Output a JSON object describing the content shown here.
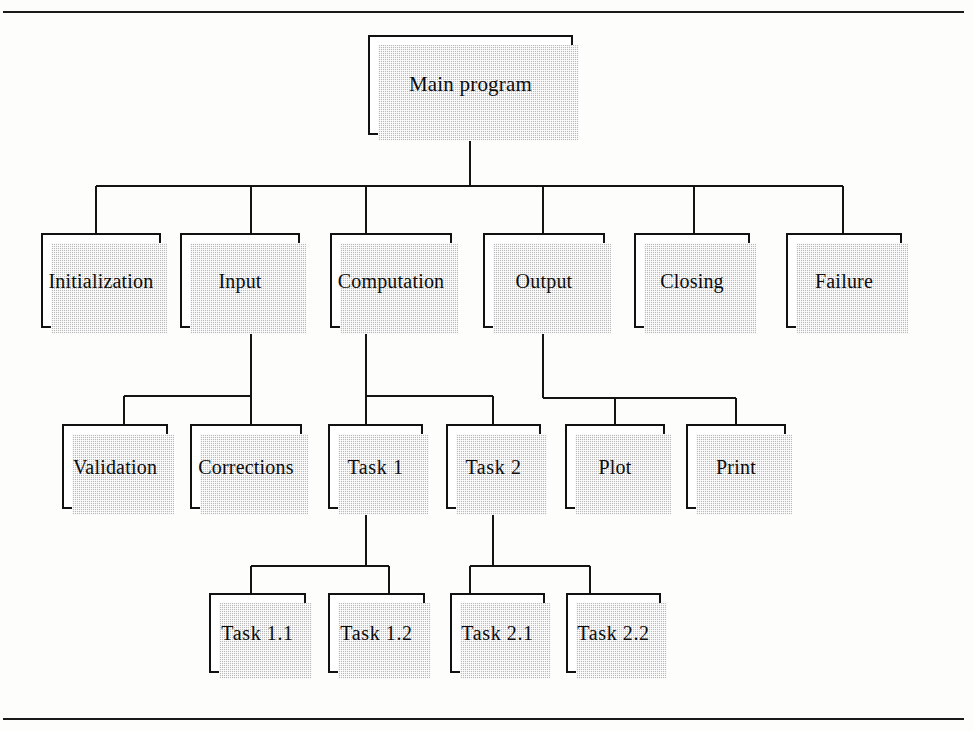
{
  "diagram": {
    "type": "hierarchy-tree",
    "frame": {
      "top_rule": true,
      "bottom_rule": true,
      "border_color": "#1a1a1a"
    },
    "style": {
      "box_fill": "#ffffff",
      "box_border": "#111111",
      "shadow_color": "#b9b9b9",
      "line_color": "#141414",
      "text_color": "#0c0c0c"
    },
    "nodes": [
      {
        "id": "main",
        "label": "Main program",
        "level": 0,
        "x": 368,
        "y": 35,
        "w": 205,
        "h": 100,
        "parent": null
      },
      {
        "id": "init",
        "label": "Initialization",
        "level": 1,
        "x": 41,
        "y": 233,
        "w": 120,
        "h": 95,
        "parent": "main"
      },
      {
        "id": "input",
        "label": "Input",
        "level": 1,
        "x": 180,
        "y": 233,
        "w": 120,
        "h": 95,
        "parent": "main"
      },
      {
        "id": "computation",
        "label": "Computation",
        "level": 1,
        "x": 330,
        "y": 233,
        "w": 122,
        "h": 95,
        "parent": "main"
      },
      {
        "id": "output",
        "label": "Output",
        "level": 1,
        "x": 483,
        "y": 233,
        "w": 122,
        "h": 95,
        "parent": "main"
      },
      {
        "id": "closing",
        "label": "Closing",
        "level": 1,
        "x": 634,
        "y": 233,
        "w": 116,
        "h": 95,
        "parent": "main"
      },
      {
        "id": "failure",
        "label": "Failure",
        "level": 1,
        "x": 786,
        "y": 233,
        "w": 116,
        "h": 95,
        "parent": "main"
      },
      {
        "id": "validation",
        "label": "Validation",
        "level": 2,
        "x": 62,
        "y": 424,
        "w": 106,
        "h": 85,
        "parent": "input"
      },
      {
        "id": "corrections",
        "label": "Corrections",
        "level": 2,
        "x": 190,
        "y": 424,
        "w": 112,
        "h": 85,
        "parent": "input"
      },
      {
        "id": "task1",
        "label": "Task 1",
        "level": 2,
        "x": 328,
        "y": 424,
        "w": 95,
        "h": 85,
        "parent": "computation"
      },
      {
        "id": "task2",
        "label": "Task 2",
        "level": 2,
        "x": 446,
        "y": 424,
        "w": 95,
        "h": 85,
        "parent": "computation"
      },
      {
        "id": "plot",
        "label": "Plot",
        "level": 2,
        "x": 565,
        "y": 424,
        "w": 100,
        "h": 85,
        "parent": "output"
      },
      {
        "id": "print",
        "label": "Print",
        "level": 2,
        "x": 686,
        "y": 424,
        "w": 100,
        "h": 85,
        "parent": "output"
      },
      {
        "id": "task11",
        "label": "Task 1.1",
        "level": 3,
        "x": 209,
        "y": 593,
        "w": 97,
        "h": 80,
        "parent": "task1"
      },
      {
        "id": "task12",
        "label": "Task 1.2",
        "level": 3,
        "x": 328,
        "y": 593,
        "w": 97,
        "h": 80,
        "parent": "task1"
      },
      {
        "id": "task21",
        "label": "Task 2.1",
        "level": 3,
        "x": 450,
        "y": 593,
        "w": 95,
        "h": 80,
        "parent": "task2"
      },
      {
        "id": "task22",
        "label": "Task 2.2",
        "level": 3,
        "x": 566,
        "y": 593,
        "w": 95,
        "h": 80,
        "parent": "task2"
      }
    ],
    "connectors": {
      "main_to_row1": {
        "stem": {
          "x": 470,
          "y_from": 135,
          "y_to": 186
        },
        "bus": {
          "y": 186,
          "x_from": 96,
          "x_to": 843
        },
        "drops": [
          {
            "x": 96,
            "y_from": 186,
            "y_to": 233,
            "to": "init"
          },
          {
            "x": 251,
            "y_from": 186,
            "y_to": 233,
            "to": "input"
          },
          {
            "x": 366,
            "y_from": 186,
            "y_to": 233,
            "to": "computation"
          },
          {
            "x": 543,
            "y_from": 186,
            "y_to": 233,
            "to": "output"
          },
          {
            "x": 694,
            "y_from": 186,
            "y_to": 233,
            "to": "closing"
          },
          {
            "x": 843,
            "y_from": 186,
            "y_to": 233,
            "to": "failure"
          }
        ]
      },
      "input_to_children": {
        "stem": {
          "x": 251,
          "y_from": 328,
          "y_to": 396
        },
        "bus": {
          "y": 396,
          "x_from": 124,
          "x_to": 251
        },
        "drops": [
          {
            "x": 124,
            "y_from": 396,
            "y_to": 424,
            "to": "validation"
          },
          {
            "x": 251,
            "y_from": 396,
            "y_to": 424,
            "to": "corrections"
          }
        ]
      },
      "computation_to_children": {
        "stem": {
          "x": 366,
          "y_from": 328,
          "y_to": 396
        },
        "bus": {
          "y": 396,
          "x_from": 366,
          "x_to": 493
        },
        "drops": [
          {
            "x": 366,
            "y_from": 396,
            "y_to": 424,
            "to": "task1"
          },
          {
            "x": 493,
            "y_from": 396,
            "y_to": 424,
            "to": "task2"
          }
        ]
      },
      "output_to_children": {
        "stem": {
          "x": 543,
          "y_from": 328,
          "y_to": 398
        },
        "bus": {
          "y": 398,
          "x_from": 543,
          "x_to": 736
        },
        "drops": [
          {
            "x": 615,
            "y_from": 398,
            "y_to": 424,
            "to": "plot"
          },
          {
            "x": 736,
            "y_from": 398,
            "y_to": 424,
            "to": "print"
          }
        ]
      },
      "task1_to_children": {
        "stem": {
          "x": 366,
          "y_from": 509,
          "y_to": 566
        },
        "bus": {
          "y": 566,
          "x_from": 251,
          "x_to": 389
        },
        "drops": [
          {
            "x": 251,
            "y_from": 566,
            "y_to": 593,
            "to": "task11"
          },
          {
            "x": 389,
            "y_from": 566,
            "y_to": 593,
            "to": "task12"
          }
        ]
      },
      "task2_to_children": {
        "stem": {
          "x": 493,
          "y_from": 509,
          "y_to": 566
        },
        "bus": {
          "y": 566,
          "x_from": 470,
          "x_to": 590
        },
        "drops": [
          {
            "x": 470,
            "y_from": 566,
            "y_to": 593,
            "to": "task21"
          },
          {
            "x": 590,
            "y_from": 566,
            "y_to": 593,
            "to": "task22"
          }
        ]
      }
    }
  }
}
